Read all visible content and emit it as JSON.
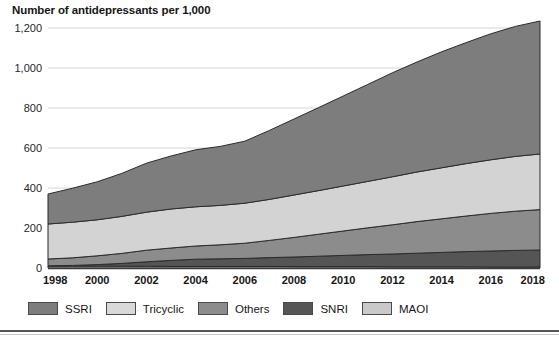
{
  "chart_data": {
    "type": "area",
    "stacked": true,
    "title": "Number of antidepressants per 1,000",
    "xlabel": "",
    "ylabel": "",
    "grid": true,
    "legend_position": "bottom",
    "ylim": [
      0,
      1200
    ],
    "yticks": [
      0,
      200,
      400,
      600,
      800,
      1000,
      1200
    ],
    "ytick_labels": [
      "0",
      "200",
      "400",
      "600",
      "800",
      "1,000",
      "1,200"
    ],
    "x": [
      1998,
      1999,
      2000,
      2001,
      2002,
      2003,
      2004,
      2005,
      2006,
      2007,
      2008,
      2009,
      2010,
      2011,
      2012,
      2013,
      2014,
      2015,
      2016,
      2017,
      2018
    ],
    "xtick_labels": [
      "1998",
      "2000",
      "2002",
      "2004",
      "2006",
      "2008",
      "2010",
      "2012",
      "2014",
      "2016",
      "2018"
    ],
    "xticks": [
      1998,
      2000,
      2002,
      2004,
      2006,
      2008,
      2010,
      2012,
      2014,
      2016,
      2018
    ],
    "stack_order_bottom_to_top": [
      "MAOI",
      "SNRI",
      "Others",
      "Tricyclic",
      "SSRI"
    ],
    "series": [
      {
        "name": "SSRI",
        "color": "#7d7d7d",
        "values": [
          150,
          170,
          190,
          215,
          245,
          265,
          285,
          295,
          310,
          345,
          380,
          415,
          450,
          485,
          520,
          550,
          580,
          605,
          630,
          650,
          665
        ]
      },
      {
        "name": "Tricyclic",
        "color": "#d3d3d3",
        "values": [
          175,
          178,
          180,
          185,
          190,
          195,
          196,
          197,
          200,
          205,
          212,
          218,
          225,
          232,
          240,
          248,
          255,
          262,
          268,
          274,
          278
        ]
      },
      {
        "name": "Others",
        "color": "#8c8c8c",
        "values": [
          34,
          38,
          44,
          50,
          58,
          62,
          66,
          70,
          76,
          86,
          98,
          110,
          122,
          134,
          146,
          158,
          168,
          178,
          188,
          196,
          202
        ]
      },
      {
        "name": "SNRI",
        "color": "#555555",
        "values": [
          2,
          4,
          8,
          14,
          22,
          30,
          36,
          38,
          40,
          44,
          48,
          52,
          56,
          60,
          64,
          68,
          72,
          76,
          80,
          83,
          85
        ]
      },
      {
        "name": "MAOI",
        "color": "#c9c9c9",
        "values": [
          9,
          9,
          9,
          9,
          9,
          8,
          8,
          8,
          8,
          8,
          7,
          7,
          7,
          7,
          6,
          6,
          6,
          6,
          5,
          5,
          5
        ]
      }
    ],
    "totals": [
      370,
      399,
      431,
      473,
      524,
      560,
      591,
      608,
      634,
      688,
      745,
      802,
      860,
      918,
      976,
      1030,
      1081,
      1127,
      1171,
      1208,
      1235
    ]
  },
  "legend": {
    "items": [
      {
        "label": "SSRI",
        "color": "#7d7d7d"
      },
      {
        "label": "Tricyclic",
        "color": "#d9d9d9"
      },
      {
        "label": "Others",
        "color": "#8c8c8c"
      },
      {
        "label": "SNRI",
        "color": "#555555"
      },
      {
        "label": "MAOI",
        "color": "#c9c9c9"
      }
    ]
  }
}
